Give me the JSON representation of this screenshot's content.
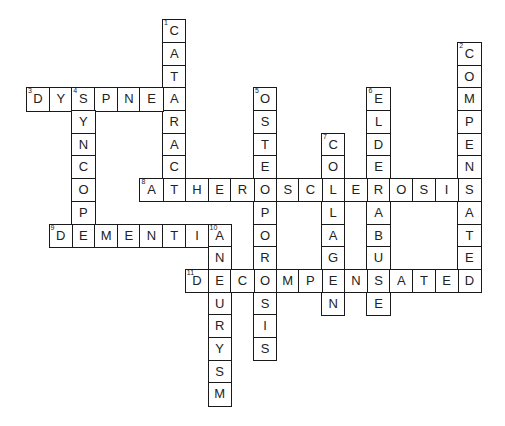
{
  "puzzle": {
    "type": "crossword",
    "grid_origin": {
      "x": 26.7,
      "y": 20
    },
    "cell_size": 22.7,
    "colors": {
      "border": "#1a1a1a",
      "text": "#222222",
      "background": "#ffffff"
    },
    "words": [
      {
        "number": 1,
        "answer": "CATARACT",
        "direction": "down",
        "row": 0,
        "col": 6
      },
      {
        "number": 2,
        "answer": "COMPENSATED",
        "direction": "down",
        "row": 1,
        "col": 19
      },
      {
        "number": 3,
        "answer": "DYSPNEA",
        "direction": "across",
        "row": 3,
        "col": 0
      },
      {
        "number": 4,
        "answer": "SYNCOPE",
        "direction": "down",
        "row": 3,
        "col": 2
      },
      {
        "number": 5,
        "answer": "OSTEOPOROSIS",
        "direction": "down",
        "row": 3,
        "col": 10
      },
      {
        "number": 6,
        "answer": "ELDERABUSE",
        "direction": "down",
        "row": 3,
        "col": 15
      },
      {
        "number": 7,
        "answer": "COLLAGEN",
        "direction": "down",
        "row": 5,
        "col": 13
      },
      {
        "number": 8,
        "answer": "ATHEROSCLEROSIS",
        "direction": "across",
        "row": 7,
        "col": 5
      },
      {
        "number": 9,
        "answer": "DEMENTIA",
        "direction": "across",
        "row": 9,
        "col": 1
      },
      {
        "number": 10,
        "answer": "ANEURYSM",
        "direction": "down",
        "row": 9,
        "col": 8
      },
      {
        "number": 11,
        "answer": "DECOMPENSATED",
        "direction": "across",
        "row": 11,
        "col": 7
      }
    ]
  }
}
